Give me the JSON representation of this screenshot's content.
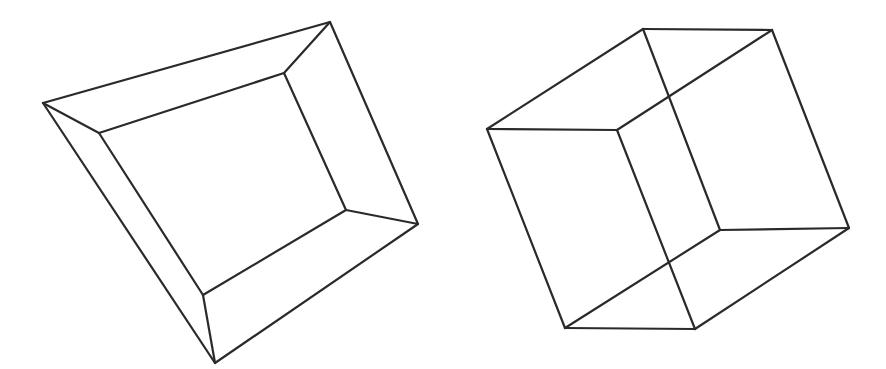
{
  "figures": [
    {
      "name": "truncated-pyramid-frame",
      "stroke_color": "#2a2a2a",
      "outer": [
        [
          43,
          103
        ],
        [
          330,
          22
        ],
        [
          418,
          224
        ],
        [
          215,
          363
        ]
      ],
      "inner": [
        [
          99,
          133
        ],
        [
          284,
          73
        ],
        [
          346,
          210
        ],
        [
          203,
          295
        ]
      ]
    },
    {
      "name": "necker-cube",
      "stroke_color": "#2a2a2a",
      "edges": [
        [
          [
            487,
            129
          ],
          [
            643,
            29
          ]
        ],
        [
          [
            643,
            29
          ],
          [
            772,
            30
          ]
        ],
        [
          [
            487,
            129
          ],
          [
            617,
            130
          ]
        ],
        [
          [
            617,
            130
          ],
          [
            772,
            30
          ]
        ],
        [
          [
            643,
            29
          ],
          [
            720,
            230
          ]
        ],
        [
          [
            617,
            130
          ],
          [
            695,
            329
          ]
        ],
        [
          [
            772,
            30
          ],
          [
            849,
            228
          ]
        ],
        [
          [
            487,
            129
          ],
          [
            565,
            328
          ]
        ],
        [
          [
            565,
            328
          ],
          [
            695,
            329
          ]
        ],
        [
          [
            695,
            329
          ],
          [
            849,
            228
          ]
        ],
        [
          [
            720,
            230
          ],
          [
            849,
            228
          ]
        ],
        [
          [
            720,
            230
          ],
          [
            565,
            328
          ]
        ]
      ]
    }
  ]
}
